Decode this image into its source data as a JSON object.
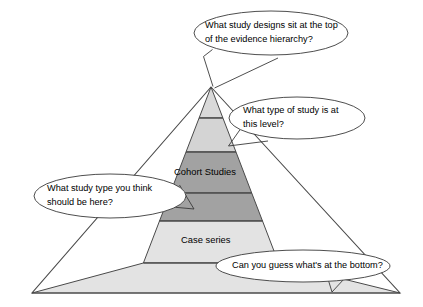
{
  "figure": {
    "type": "pyramid-diagram",
    "background_color": "#ffffff",
    "outline_color": "#4a4a4a"
  },
  "pyramid": {
    "apex": {
      "x": 211,
      "y": 87
    },
    "base": {
      "left_x": 32,
      "right_x": 400,
      "y": 293
    },
    "tiers": [
      {
        "id": "tier-1",
        "label": "",
        "fill": "#d9d9d9",
        "top_y": 87,
        "bottom_y": 118
      },
      {
        "id": "tier-2",
        "label": "",
        "fill": "#d4d4d4",
        "top_y": 118,
        "bottom_y": 152
      },
      {
        "id": "tier-3",
        "label": "Cohort Studies",
        "fill": "#a2a2a2",
        "top_y": 152,
        "bottom_y": 193
      },
      {
        "id": "tier-4",
        "label": "",
        "fill": "#a2a2a2",
        "top_y": 193,
        "bottom_y": 221
      },
      {
        "id": "tier-5",
        "label": "Case series",
        "fill": "#e3e3e3",
        "top_y": 221,
        "bottom_y": 263
      },
      {
        "id": "tier-6",
        "label": "",
        "fill": "#e3e3e3",
        "top_y": 263,
        "bottom_y": 293
      }
    ],
    "labels": {
      "cohort_studies": "Cohort Studies",
      "case_series": "Case series"
    }
  },
  "callouts": [
    {
      "id": "callout-top",
      "lines": [
        "What study designs sit at the top",
        "of the evidence hierarchy?"
      ],
      "points_to": "pyramid-apex"
    },
    {
      "id": "callout-second-level",
      "lines": [
        "What type of study is at",
        "this level?"
      ],
      "points_to": "tier-2"
    },
    {
      "id": "callout-left",
      "lines": [
        "What study type you think",
        "should be here?"
      ],
      "points_to": "tier-4"
    },
    {
      "id": "callout-bottom",
      "lines": [
        "Can you guess what's at the bottom?"
      ],
      "points_to": "tier-6"
    }
  ]
}
